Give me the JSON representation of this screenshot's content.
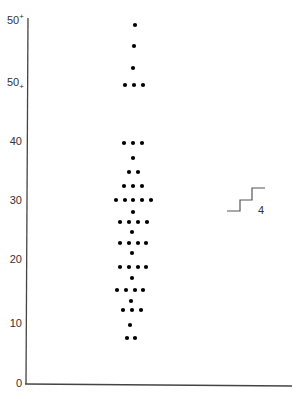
{
  "chart_data": {
    "type": "scatter",
    "subtype": "dot-plot",
    "title": "",
    "xlabel": "",
    "ylabel": "",
    "ylim": [
      0,
      55
    ],
    "grid": false,
    "y_ticks": [
      {
        "label": "0",
        "value": 0,
        "y": 383
      },
      {
        "label": "10",
        "value": 10,
        "y": 323
      },
      {
        "label": "20",
        "value": 20,
        "y": 259
      },
      {
        "label": "30",
        "value": 30,
        "y": 200
      },
      {
        "label": "40",
        "value": 40,
        "y": 141
      },
      {
        "label": "50",
        "sup": "+",
        "value": 50,
        "y": 82,
        "marker": "50+ (subscript)"
      },
      {
        "label": "50",
        "sup": "+",
        "value": 55,
        "y": 20,
        "marker": "50+ (superscript)"
      }
    ],
    "rows": [
      {
        "y": 25,
        "count": 1,
        "xs": [
          135
        ]
      },
      {
        "y": 46,
        "count": 1,
        "xs": [
          134
        ]
      },
      {
        "y": 68,
        "count": 1,
        "xs": [
          133
        ]
      },
      {
        "y": 85,
        "count": 3,
        "xs": [
          125,
          134,
          143
        ]
      },
      {
        "y": 143,
        "count": 3,
        "xs": [
          124,
          133,
          142
        ]
      },
      {
        "y": 158,
        "count": 1,
        "xs": [
          133
        ]
      },
      {
        "y": 172,
        "count": 2,
        "xs": [
          129,
          138
        ]
      },
      {
        "y": 186,
        "count": 3,
        "xs": [
          124,
          133,
          142
        ]
      },
      {
        "y": 200,
        "count": 5,
        "xs": [
          116,
          125,
          133,
          142,
          151
        ]
      },
      {
        "y": 212,
        "count": 1,
        "xs": [
          133
        ]
      },
      {
        "y": 222,
        "count": 4,
        "xs": [
          120,
          129,
          138,
          147
        ]
      },
      {
        "y": 232,
        "count": 1,
        "xs": [
          132
        ]
      },
      {
        "y": 243,
        "count": 4,
        "xs": [
          120,
          129,
          138,
          146
        ]
      },
      {
        "y": 253,
        "count": 1,
        "xs": [
          132
        ]
      },
      {
        "y": 267,
        "count": 4,
        "xs": [
          120,
          129,
          138,
          146
        ]
      },
      {
        "y": 278,
        "count": 1,
        "xs": [
          132
        ]
      },
      {
        "y": 290,
        "count": 4,
        "xs": [
          117,
          126,
          135,
          143
        ]
      },
      {
        "y": 301,
        "count": 1,
        "xs": [
          131
        ]
      },
      {
        "y": 310,
        "count": 3,
        "xs": [
          123,
          132,
          141
        ]
      },
      {
        "y": 325,
        "count": 1,
        "xs": [
          130
        ]
      },
      {
        "y": 338,
        "count": 2,
        "xs": [
          127,
          135
        ]
      }
    ],
    "values_by_level": [
      {
        "value": 56,
        "count": 1
      },
      {
        "value": 53,
        "count": 1
      },
      {
        "value": 51,
        "count": 1
      },
      {
        "value": 50,
        "count": 3
      },
      {
        "value": 40,
        "count": 3
      },
      {
        "value": 37,
        "count": 1
      },
      {
        "value": 35,
        "count": 2
      },
      {
        "value": 33,
        "count": 3
      },
      {
        "value": 30,
        "count": 5
      },
      {
        "value": 28,
        "count": 1
      },
      {
        "value": 27,
        "count": 4
      },
      {
        "value": 25,
        "count": 1
      },
      {
        "value": 23,
        "count": 4
      },
      {
        "value": 22,
        "count": 1
      },
      {
        "value": 19,
        "count": 4
      },
      {
        "value": 17,
        "count": 1
      },
      {
        "value": 15,
        "count": 4
      },
      {
        "value": 13,
        "count": 1
      },
      {
        "value": 12,
        "count": 3
      },
      {
        "value": 9,
        "count": 1
      },
      {
        "value": 7,
        "count": 2
      }
    ],
    "annotation": {
      "text": "4",
      "shape": "staircase",
      "x": 227,
      "y": 187
    }
  }
}
